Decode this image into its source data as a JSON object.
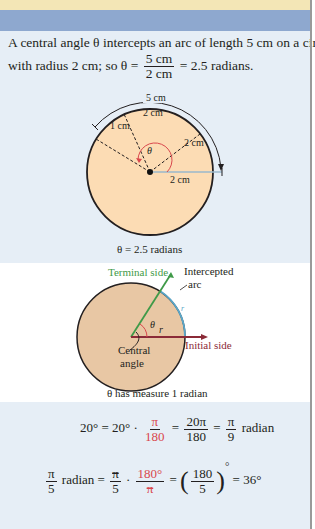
{
  "header": {
    "band_colors": {
      "yellow": "#f3e6b6",
      "blue": "#8ea8cf"
    }
  },
  "example1": {
    "line1": "A central angle θ intercepts an arc of length 5 cm on a circle",
    "line2_prefix": "with radius 2 cm; so θ =",
    "fraction_num": "5 cm",
    "fraction_den": "2 cm",
    "line2_suffix": "= 2.5 radians.",
    "figure": {
      "arc_label": "5 cm",
      "segment_labels": [
        "1 cm",
        "2 cm",
        "2 cm"
      ],
      "radius_label": "2 cm",
      "angle_symbol": "θ",
      "caption": "θ = 2.5 radians"
    }
  },
  "example2": {
    "figure": {
      "terminal_side": "Terminal side",
      "intercepted_arc_line1": "Intercepted",
      "intercepted_arc_line2": "arc",
      "arc_r": "r",
      "radius_r": "r",
      "angle_symbol": "θ",
      "initial_side": "Initial side",
      "central_angle_line1": "Central",
      "central_angle_line2": "angle",
      "caption": "θ has measure 1 radian"
    },
    "colors": {
      "terminal": "#3f9a48",
      "initial": "#8b2a37",
      "arc": "#5aa6c8",
      "fill": "#e8c7a4"
    }
  },
  "conversions": {
    "deg_to_rad": {
      "lhs": "20° = 20° ·",
      "f1_num": "π",
      "f1_den": "180",
      "eq1": "=",
      "f2_num": "20π",
      "f2_den": "180",
      "eq2": "=",
      "f3_num": "π",
      "f3_den": "9",
      "unit": "radian"
    },
    "rad_to_deg": {
      "f1_num": "π",
      "f1_den": "5",
      "unit": "radian =",
      "f2_num": "π",
      "f2_den": "5",
      "dot": "·",
      "f3_num": "180°",
      "f3_den": "π",
      "eq1": "=",
      "f4_num": "180",
      "f4_den": "5",
      "deg": "°",
      "result": "= 36°"
    }
  }
}
